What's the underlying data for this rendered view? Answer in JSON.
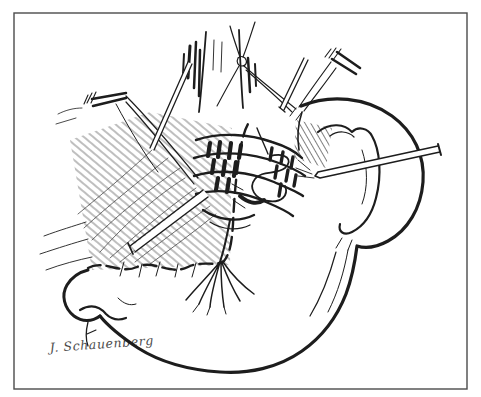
{
  "figure": {
    "kind": "hand-drawn surgical line illustration",
    "signature": "J. Schauenberg",
    "colors": {
      "paper": "#ffffff",
      "ink": "#1d1d1d",
      "border": "#4b4b4b"
    }
  }
}
